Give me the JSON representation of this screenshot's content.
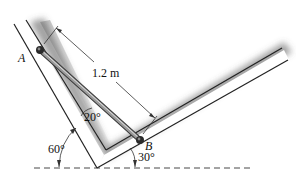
{
  "figure": {
    "type": "statics-diagram"
  },
  "labels": {
    "point_a": "A",
    "point_b": "B",
    "length": "1.2 m",
    "angle_rod": "20°",
    "angle_left_wall": "60°",
    "angle_right_wall": "30°"
  },
  "geometry": {
    "rod_length_m": 1.2,
    "left_wall_angle_deg": 60,
    "right_wall_angle_deg": 30,
    "rod_to_left_wall_angle_deg": 20
  },
  "colors": {
    "wall_edge": "#222222",
    "wall_fill": "#ffffff",
    "shadow": "#6f6f6f",
    "rod": "#7a7a7a",
    "rod_highlight": "#d9d9d9",
    "text": "#111111",
    "dashed_line": "#333333"
  }
}
